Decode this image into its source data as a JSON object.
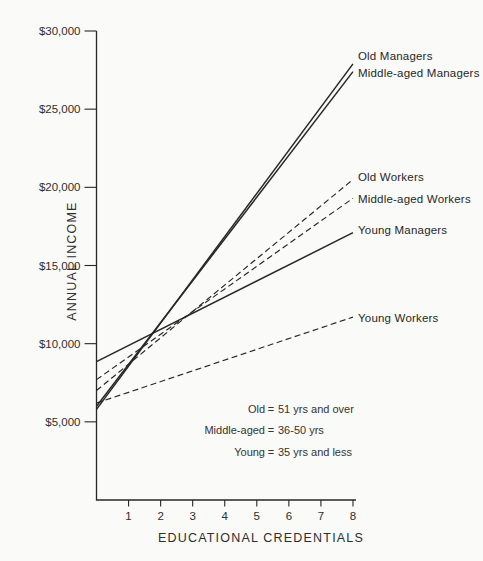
{
  "page": {
    "background": "#fafaf8",
    "ink": "#272727"
  },
  "chart_data": {
    "type": "line",
    "title": "",
    "xlabel": "EDUCATIONAL CREDENTIALS",
    "ylabel": "ANNUAL INCOME",
    "xlim": [
      0,
      8.1
    ],
    "ylim": [
      0,
      30000
    ],
    "grid": false,
    "x_ticks": [
      "1",
      "2",
      "3",
      "4",
      "5",
      "6",
      "7",
      "8"
    ],
    "y_ticks": [
      30000,
      25000,
      20000,
      15000,
      10000,
      5000
    ],
    "y_tick_labels": [
      "$30,000",
      "$25,000",
      "$20,000",
      "$15,000",
      "$10,000",
      "$5,000"
    ],
    "series": [
      {
        "name": "Old Managers",
        "style": "solid",
        "x": [
          0,
          8
        ],
        "values": [
          5800,
          27900
        ]
      },
      {
        "name": "Middle-aged Managers",
        "style": "solid",
        "x": [
          0,
          8
        ],
        "values": [
          6000,
          27400
        ]
      },
      {
        "name": "Old Workers",
        "style": "dashed",
        "x": [
          0,
          8
        ],
        "values": [
          7000,
          20500
        ]
      },
      {
        "name": "Middle-aged Workers",
        "style": "dashed",
        "x": [
          0,
          8
        ],
        "values": [
          7700,
          19300
        ]
      },
      {
        "name": "Young Managers",
        "style": "solid",
        "x": [
          0,
          8
        ],
        "values": [
          8850,
          17100
        ]
      },
      {
        "name": "Young Workers",
        "style": "dashed",
        "x": [
          0,
          8
        ],
        "values": [
          6200,
          11700
        ]
      }
    ],
    "legend_note": {
      "separator": "=",
      "rows": [
        {
          "label": "Old",
          "text": "51 yrs and over"
        },
        {
          "label": "Middle-aged",
          "text": "36-50 yrs"
        },
        {
          "label": "Young",
          "text": "35 yrs and less"
        }
      ]
    }
  }
}
